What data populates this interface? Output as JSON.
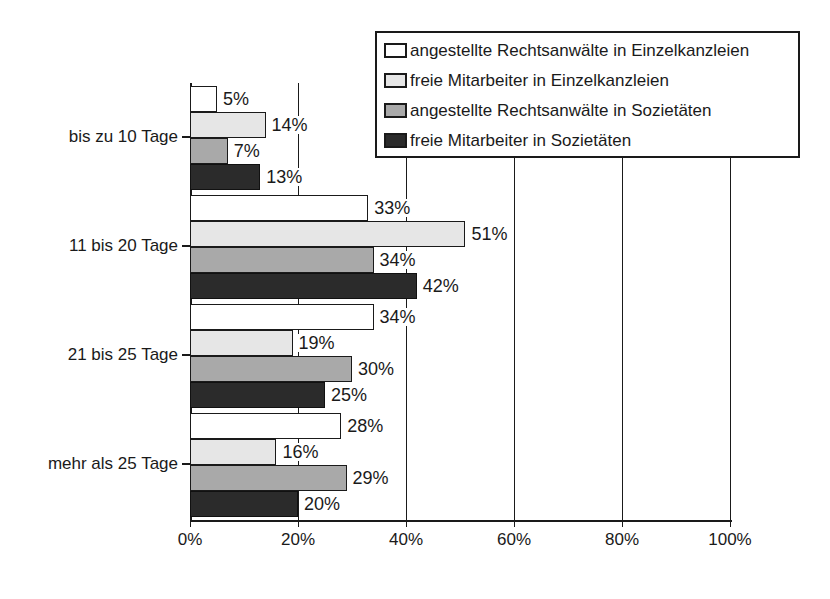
{
  "chart_data": {
    "type": "bar",
    "orientation": "horizontal",
    "title": "",
    "subtitle": "",
    "xlabel": "",
    "ylabel": "",
    "xlim": [
      0,
      100
    ],
    "xtick_labels": [
      "0%",
      "20%",
      "40%",
      "60%",
      "80%",
      "100%"
    ],
    "xtick_values": [
      0,
      20,
      40,
      60,
      80,
      100
    ],
    "grid": true,
    "grid_axis": "x",
    "legend_position": "top-right",
    "value_label_suffix": "%",
    "categories": [
      "bis zu 10 Tage",
      "11 bis 20 Tage",
      "21 bis 25 Tage",
      "mehr als 25 Tage"
    ],
    "series": [
      {
        "name": "angestellte Rechtsanwälte in Einzelkanzleien",
        "color": "#ffffff",
        "values": [
          5,
          33,
          34,
          28
        ],
        "labels": [
          "5%",
          "33%",
          "34%",
          "28%"
        ]
      },
      {
        "name": "freie Mitarbeiter in Einzelkanzleien",
        "color": "#e6e6e6",
        "values": [
          14,
          51,
          19,
          16
        ],
        "labels": [
          "14%",
          "51%",
          "19%",
          "16%"
        ]
      },
      {
        "name": "angestellte Rechtsanwälte in Sozietäten",
        "color": "#a9a9a9",
        "values": [
          7,
          34,
          30,
          29
        ],
        "labels": [
          "7%",
          "34%",
          "30%",
          "29%"
        ]
      },
      {
        "name": "freie Mitarbeiter in Sozietäten",
        "color": "#2b2b2b",
        "values": [
          13,
          42,
          25,
          20
        ],
        "labels": [
          "13%",
          "42%",
          "25%",
          "20%"
        ]
      }
    ]
  }
}
